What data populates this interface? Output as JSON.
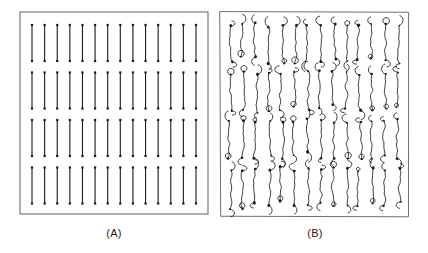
{
  "figure": {
    "background_color": "#ffffff",
    "ink_color": "#1b1b1b",
    "frame_color": "#6f6f6f",
    "panels": [
      {
        "id": "A",
        "caption": "(A)",
        "kind": "ideal-stimulus-grid",
        "description": "Regular grid of straight vertical line segments with square dot terminators",
        "frame": {
          "x": 2,
          "y": 2,
          "width": 188,
          "height": 202
        },
        "grid": {
          "columns": 14,
          "rows": 4
        },
        "stroke_width": 1.1,
        "dot_size": 2.2
      },
      {
        "id": "B",
        "caption": "(B)",
        "kind": "hand-drawn-reproduction",
        "description": "Hand drawn copies of the same vertical strokes, wobbly with curled hooks and ink blobs at the terminators",
        "frame": {
          "x": 3,
          "y": 3,
          "width": 190,
          "height": 206
        },
        "grid": {
          "columns": 14,
          "rows": 4
        },
        "stroke_width": 0.85,
        "dot_size": 2.0
      }
    ]
  },
  "chart_data": {
    "type": "scatter",
    "title": "",
    "xlabel": "",
    "ylabel": "",
    "grid": false,
    "legend": null,
    "panels": [
      {
        "name": "(A)",
        "columns": 14,
        "rows": 4,
        "segment_count": 56,
        "segment_orientation": "vertical",
        "segment_length_px": 36,
        "column_pitch_px": 13.0,
        "row_pitch_px": 47.5,
        "jitter": 0
      },
      {
        "name": "(B)",
        "columns": 14,
        "rows": 4,
        "segment_count": 56,
        "segment_orientation": "vertical",
        "segment_length_px": 36,
        "column_pitch_px": 13.2,
        "row_pitch_px": 48.0,
        "jitter": "hand-drawn"
      }
    ]
  }
}
